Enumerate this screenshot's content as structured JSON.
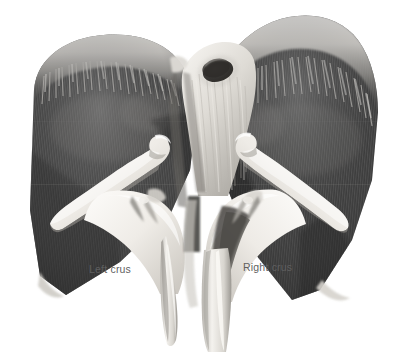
{
  "figure": {
    "type": "anatomical-illustration",
    "view": "inferior-posterior",
    "rendering": "grayscale",
    "background_color": "#ffffff",
    "width": 409,
    "height": 354
  },
  "labels": [
    {
      "id": "left-crus",
      "text": "Left crus",
      "color": "#5f5f5f",
      "x": 89,
      "y": 264
    },
    {
      "id": "right-crus",
      "text": "Right crus",
      "color": "#5f5f5f",
      "x": 243,
      "y": 262
    }
  ],
  "structures": [
    {
      "id": "left-hemidiaphragm-dome",
      "name": "Left hemidiaphragm (muscular dome)",
      "tone": "#4a4a4a"
    },
    {
      "id": "right-hemidiaphragm-dome",
      "name": "Right hemidiaphragm (muscular dome)",
      "tone": "#3f3f3f"
    },
    {
      "id": "central-tendon",
      "name": "Central tendon",
      "tone": "#e8e6e2"
    },
    {
      "id": "aortic-hiatus",
      "name": "Hiatus opening",
      "tone": "#3a3a3a"
    },
    {
      "id": "left-crus-tendon",
      "name": "Left crus tendon",
      "tone": "#f0eee9"
    },
    {
      "id": "right-crus-tendon",
      "name": "Right crus tendon",
      "tone": "#f2f0ec"
    },
    {
      "id": "left-costal-slip",
      "name": "Left costal slip / rib",
      "tone": "#efede8"
    },
    {
      "id": "right-costal-slip",
      "name": "Right costal slip / rib",
      "tone": "#f1efea"
    }
  ],
  "palette": {
    "background": "#ffffff",
    "muscle_dark": "#343434",
    "muscle_mid": "#585858",
    "muscle_light": "#8d8d8d",
    "tendon_highlight": "#f6f4f0",
    "tendon_shadow": "#bcb9b4",
    "label_text": "#5f5f5f"
  }
}
